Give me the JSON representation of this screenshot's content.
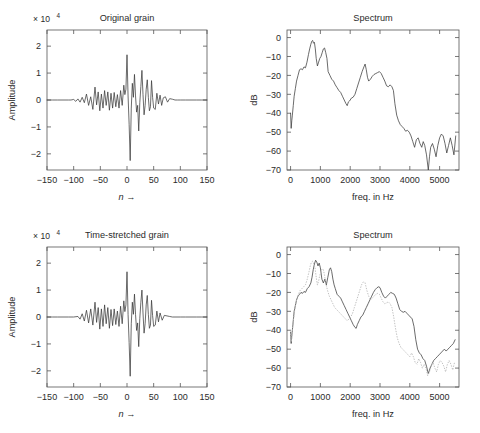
{
  "figure": {
    "width": 480,
    "height": 433,
    "background": "#ffffff",
    "line_color": "#3a3a3a",
    "dotted_color": "#b9b9b9",
    "axis_color": "#565656"
  },
  "panels": [
    {
      "id": "original-grain",
      "title": "Original grain",
      "xlabel": "n →",
      "ylabel": "Amplitude",
      "exponent_label": "× 10",
      "exponent_power": "4"
    },
    {
      "id": "original-spectrum",
      "title": "Spectrum",
      "xlabel": "freq. in Hz",
      "ylabel": "dB"
    },
    {
      "id": "time-stretched-grain",
      "title": "Time-stretched grain",
      "xlabel": "n →",
      "ylabel": "Amplitude",
      "exponent_label": "× 10",
      "exponent_power": "4"
    },
    {
      "id": "stretched-spectrum",
      "title": "Spectrum",
      "xlabel": "freq. in Hz",
      "ylabel": "dB"
    }
  ],
  "chart_data": [
    {
      "type": "line",
      "id": "original-grain",
      "title": "Original grain",
      "xlabel": "n →",
      "ylabel": "Amplitude",
      "yscale_exponent": 4,
      "xlim": [
        -150,
        150
      ],
      "ylim": [
        -2.6,
        2.6
      ],
      "xticks": [
        -150,
        -100,
        -50,
        0,
        50,
        100,
        150
      ],
      "yticks": [
        -2,
        -1,
        0,
        1,
        2
      ],
      "grid": false,
      "legend": "none",
      "x": [
        -150,
        -140,
        -130,
        -120,
        -110,
        -105,
        -100,
        -96,
        -92,
        -88,
        -84,
        -80,
        -76,
        -72,
        -68,
        -64,
        -60,
        -57,
        -54,
        -51,
        -48,
        -45,
        -42,
        -39,
        -36,
        -33,
        -30,
        -27,
        -24,
        -21,
        -18,
        -15,
        -12,
        -9,
        -6,
        -4,
        -2,
        0,
        2,
        4,
        6,
        8,
        10,
        12,
        14,
        16,
        18,
        20,
        22,
        24,
        26,
        28,
        30,
        32,
        34,
        36,
        38,
        40,
        42,
        44,
        46,
        48,
        50,
        53,
        56,
        59,
        62,
        65,
        68,
        72,
        76,
        80,
        85,
        90,
        95,
        100,
        110,
        120,
        130,
        140,
        150
      ],
      "y": [
        0.0,
        0.0,
        0.0,
        0.0,
        0.0,
        0.0,
        0.02,
        -0.05,
        0.04,
        -0.08,
        0.1,
        -0.1,
        0.22,
        -0.2,
        0.12,
        -0.35,
        0.48,
        -0.18,
        0.3,
        -0.4,
        0.22,
        -0.3,
        0.35,
        -0.2,
        0.3,
        -0.38,
        0.25,
        -0.3,
        0.28,
        -0.25,
        0.2,
        -0.3,
        0.35,
        -0.2,
        0.55,
        0.2,
        0.4,
        1.68,
        0.15,
        -0.9,
        -2.25,
        -0.3,
        0.62,
        0.1,
        0.95,
        0.15,
        -0.45,
        -0.2,
        -1.15,
        -0.1,
        0.5,
        1.1,
        0.2,
        -0.55,
        -0.2,
        0.4,
        0.75,
        0.1,
        -0.4,
        -0.25,
        0.72,
        0.1,
        -0.3,
        -0.35,
        0.25,
        -0.15,
        0.18,
        -0.2,
        0.08,
        0.12,
        -0.08,
        0.05,
        0.03,
        0.0,
        0.0,
        0.0,
        0.0,
        0.0,
        0.0,
        0.0,
        0.0
      ]
    },
    {
      "type": "line",
      "id": "original-spectrum",
      "title": "Spectrum",
      "xlabel": "freq. in Hz",
      "ylabel": "dB",
      "xlim": [
        -120,
        5650
      ],
      "ylim": [
        -70,
        4
      ],
      "xticks": [
        0,
        1000,
        2000,
        3000,
        4000,
        5000
      ],
      "yticks": [
        0,
        -10,
        -20,
        -30,
        -40,
        -50,
        -60,
        -70
      ],
      "grid": false,
      "legend": "none",
      "x": [
        0,
        20,
        40,
        60,
        90,
        120,
        160,
        200,
        250,
        300,
        350,
        400,
        450,
        500,
        550,
        600,
        640,
        680,
        710,
        740,
        770,
        800,
        830,
        860,
        900,
        940,
        980,
        1020,
        1060,
        1100,
        1140,
        1180,
        1220,
        1260,
        1320,
        1380,
        1440,
        1500,
        1560,
        1620,
        1680,
        1740,
        1800,
        1860,
        1900,
        1940,
        1980,
        2040,
        2100,
        2160,
        2220,
        2280,
        2340,
        2400,
        2460,
        2500,
        2540,
        2580,
        2620,
        2680,
        2740,
        2800,
        2860,
        2920,
        2980,
        3040,
        3100,
        3160,
        3220,
        3280,
        3340,
        3400,
        3450,
        3500,
        3560,
        3620,
        3680,
        3740,
        3800,
        3860,
        3920,
        3980,
        4040,
        4100,
        4160,
        4220,
        4280,
        4340,
        4400,
        4450,
        4500,
        4560,
        4620,
        4660,
        4700,
        4760,
        4820,
        4880,
        4940,
        5000,
        5060,
        5120,
        5180,
        5240,
        5300,
        5360,
        5420,
        5480,
        5540
      ],
      "y": [
        -40,
        -48,
        -44,
        -41,
        -36,
        -31,
        -27,
        -23,
        -20,
        -17,
        -16.5,
        -17,
        -15.5,
        -16,
        -13,
        -9,
        -6,
        -3.5,
        -2,
        -1.5,
        -3,
        -2.5,
        -6,
        -11,
        -15,
        -13,
        -11,
        -10,
        -8,
        -6,
        -5.5,
        -8,
        -11,
        -18,
        -20,
        -22,
        -23,
        -25,
        -26.5,
        -28,
        -29,
        -31,
        -33,
        -35,
        -36,
        -34,
        -33.5,
        -32,
        -31.5,
        -30,
        -27,
        -24,
        -21,
        -18,
        -15.5,
        -14,
        -17,
        -21,
        -23,
        -22,
        -20.5,
        -19.5,
        -19,
        -18.5,
        -18,
        -19,
        -21,
        -23,
        -25.5,
        -26,
        -25,
        -26,
        -28,
        -35,
        -41,
        -44,
        -46,
        -47,
        -48,
        -49.5,
        -49,
        -50,
        -52,
        -55,
        -58,
        -54,
        -53,
        -56,
        -58,
        -55,
        -57,
        -62,
        -70,
        -63,
        -58,
        -56,
        -59,
        -63,
        -57,
        -53,
        -51,
        -52,
        -56,
        -61,
        -57,
        -53,
        -57,
        -62,
        -52
      ]
    },
    {
      "type": "line",
      "id": "time-stretched-grain",
      "title": "Time-stretched grain",
      "xlabel": "n →",
      "ylabel": "Amplitude",
      "yscale_exponent": 4,
      "xlim": [
        -150,
        150
      ],
      "ylim": [
        -2.6,
        2.6
      ],
      "xticks": [
        -150,
        -100,
        -50,
        0,
        50,
        100,
        150
      ],
      "yticks": [
        -2,
        -1,
        0,
        1,
        2
      ],
      "grid": false,
      "legend": "none",
      "x": [
        -150,
        -140,
        -130,
        -120,
        -110,
        -100,
        -92,
        -88,
        -84,
        -80,
        -76,
        -72,
        -68,
        -64,
        -60,
        -57,
        -54,
        -51,
        -48,
        -45,
        -42,
        -39,
        -36,
        -33,
        -30,
        -27,
        -24,
        -21,
        -18,
        -15,
        -12,
        -9,
        -6,
        -4,
        -2,
        0,
        2,
        4,
        6,
        8,
        10,
        12,
        14,
        16,
        18,
        20,
        22,
        24,
        26,
        28,
        30,
        32,
        34,
        36,
        38,
        40,
        42,
        44,
        46,
        48,
        50,
        53,
        56,
        59,
        62,
        66,
        70,
        75,
        80,
        85,
        90,
        100,
        110,
        120,
        130,
        140,
        150
      ],
      "y": [
        0.0,
        0.0,
        0.0,
        0.0,
        0.0,
        0.0,
        0.02,
        -0.08,
        0.12,
        -0.15,
        0.25,
        -0.22,
        0.3,
        -0.3,
        0.55,
        -0.2,
        0.35,
        -0.45,
        0.3,
        -0.35,
        0.45,
        -0.25,
        0.35,
        -0.42,
        0.28,
        -0.32,
        0.3,
        -0.28,
        0.22,
        -0.35,
        0.4,
        -0.25,
        0.6,
        0.2,
        0.45,
        1.68,
        0.1,
        -0.95,
        -2.2,
        -0.25,
        0.55,
        0.1,
        0.85,
        0.1,
        -0.5,
        -0.22,
        -1.1,
        -0.05,
        0.55,
        1.0,
        0.15,
        -0.6,
        -0.25,
        0.45,
        0.8,
        0.1,
        -0.42,
        -0.3,
        0.62,
        0.05,
        -0.35,
        -0.3,
        0.22,
        -0.18,
        0.15,
        -0.12,
        0.06,
        0.04,
        0.02,
        0.0,
        0.0,
        0.0,
        0.0,
        0.0,
        0.0,
        0.0,
        0.0
      ]
    },
    {
      "type": "line",
      "id": "stretched-spectrum",
      "title": "Spectrum",
      "xlabel": "freq. in Hz",
      "ylabel": "dB",
      "xlim": [
        -120,
        5650
      ],
      "ylim": [
        -70,
        4
      ],
      "xticks": [
        0,
        1000,
        2000,
        3000,
        4000,
        5000
      ],
      "yticks": [
        0,
        -10,
        -20,
        -30,
        -40,
        -50,
        -60,
        -70
      ],
      "grid": false,
      "legend": "none",
      "series": [
        {
          "name": "time-stretched spectrum",
          "style": "solid",
          "color": "#3a3a3a",
          "x": [
            0,
            20,
            40,
            60,
            90,
            120,
            160,
            200,
            250,
            300,
            350,
            400,
            450,
            500,
            560,
            620,
            680,
            720,
            760,
            800,
            840,
            880,
            920,
            960,
            1000,
            1050,
            1100,
            1150,
            1200,
            1250,
            1300,
            1340,
            1380,
            1420,
            1460,
            1500,
            1560,
            1620,
            1680,
            1740,
            1800,
            1860,
            1920,
            1980,
            2040,
            2100,
            2160,
            2200,
            2240,
            2300,
            2360,
            2420,
            2480,
            2540,
            2600,
            2660,
            2720,
            2780,
            2840,
            2900,
            2960,
            3000,
            3060,
            3120,
            3180,
            3240,
            3300,
            3360,
            3420,
            3480,
            3540,
            3600,
            3660,
            3720,
            3780,
            3840,
            3900,
            3960,
            4020,
            4080,
            4140,
            4200,
            4260,
            4320,
            4380,
            4440,
            4500,
            4560,
            4620,
            4680,
            4740,
            4800,
            4860,
            4920,
            4980,
            5040,
            5100,
            5160,
            5220,
            5280,
            5340,
            5400,
            5460,
            5520
          ],
          "y": [
            -41,
            -47,
            -43,
            -40,
            -35,
            -30,
            -27,
            -24,
            -22,
            -21,
            -20,
            -20.5,
            -19.5,
            -20,
            -18,
            -17,
            -15,
            -12,
            -8,
            -5,
            -3,
            -4,
            -6,
            -4.5,
            -7,
            -13,
            -15,
            -13,
            -16,
            -12,
            -8,
            -7,
            -9,
            -13,
            -16,
            -18,
            -21,
            -22,
            -23,
            -25,
            -27,
            -29,
            -31,
            -33,
            -35,
            -37,
            -38.5,
            -39,
            -37,
            -35,
            -33,
            -32,
            -30,
            -28,
            -26,
            -24,
            -22,
            -20,
            -18.5,
            -17.5,
            -17,
            -17.5,
            -20,
            -22,
            -23,
            -22,
            -21,
            -20,
            -20.5,
            -21,
            -23,
            -26,
            -29,
            -30,
            -30.5,
            -30,
            -31,
            -32,
            -33,
            -34,
            -38,
            -45,
            -50,
            -52,
            -53,
            -55,
            -56,
            -59,
            -63,
            -60,
            -58,
            -56,
            -55,
            -54,
            -53,
            -52,
            -51,
            -50,
            -51,
            -50,
            -49,
            -48,
            -47,
            -45,
            -43
          ]
        },
        {
          "name": "original spectrum (reference)",
          "style": "dotted",
          "color": "#b9b9b9",
          "x": [
            0,
            30,
            60,
            100,
            150,
            200,
            260,
            320,
            380,
            440,
            500,
            560,
            620,
            660,
            700,
            740,
            780,
            820,
            860,
            900,
            940,
            980,
            1020,
            1060,
            1100,
            1140,
            1180,
            1240,
            1300,
            1360,
            1420,
            1480,
            1540,
            1600,
            1660,
            1720,
            1780,
            1840,
            1900,
            1960,
            2020,
            2080,
            2140,
            2200,
            2260,
            2320,
            2380,
            2440,
            2500,
            2560,
            2620,
            2680,
            2740,
            2800,
            2860,
            2920,
            2980,
            3040,
            3100,
            3160,
            3220,
            3280,
            3340,
            3400,
            3460,
            3520,
            3580,
            3640,
            3700,
            3760,
            3820,
            3880,
            3940,
            4000,
            4060,
            4120,
            4180,
            4240,
            4300,
            4360,
            4420,
            4480,
            4540,
            4600,
            4660,
            4720,
            4780,
            4840,
            4900,
            4960,
            5020,
            5080,
            5140,
            5200,
            5260,
            5320,
            5380,
            5440,
            5500
          ],
          "y": [
            -42,
            -46,
            -40,
            -34,
            -28,
            -24,
            -21,
            -19,
            -18,
            -17,
            -16,
            -13,
            -9,
            -6,
            -4,
            -3.5,
            -5,
            -7,
            -12,
            -16,
            -14,
            -11,
            -9,
            -7.5,
            -8,
            -11,
            -15,
            -19,
            -22,
            -24,
            -26,
            -28,
            -29,
            -30,
            -31,
            -32,
            -33,
            -34,
            -35,
            -34,
            -33,
            -31,
            -28,
            -25,
            -22,
            -19,
            -16,
            -14.5,
            -15,
            -19,
            -22,
            -24,
            -23,
            -22,
            -21,
            -20.5,
            -21,
            -23,
            -25,
            -26,
            -25.5,
            -25,
            -26,
            -28,
            -33,
            -39,
            -44,
            -47,
            -49,
            -50,
            -51,
            -52,
            -53,
            -54,
            -52,
            -54,
            -57,
            -58,
            -55,
            -57,
            -60,
            -58,
            -60,
            -64,
            -62,
            -59,
            -57,
            -60,
            -62,
            -58,
            -56,
            -57,
            -59,
            -62,
            -58,
            -56,
            -58,
            -61,
            -57
          ]
        }
      ]
    }
  ]
}
